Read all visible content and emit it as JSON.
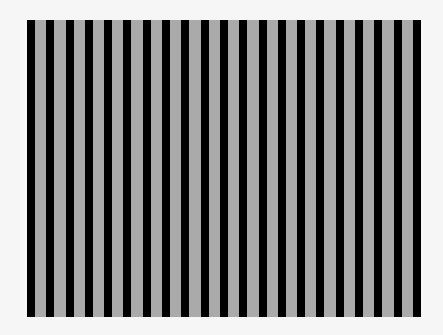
{
  "image": {
    "subject": "vertical stripe grating pattern",
    "panel": {
      "left": 27,
      "top": 20,
      "width": 394,
      "height": 297
    },
    "colors": {
      "dark_stripe": "#000000",
      "light_stripe": "#aaaaaa",
      "page_background": "#f6f6f6"
    },
    "stripe_count_dark": 21,
    "stripe_count_light": 20,
    "dark_stripe_width": 8,
    "light_stripe_width": 11.3
  }
}
